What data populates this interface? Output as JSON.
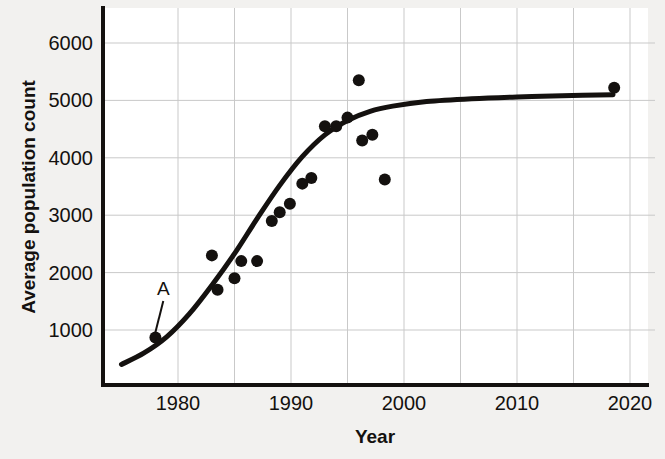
{
  "chart_data": {
    "type": "scatter",
    "title": "",
    "xlabel": "Year",
    "ylabel": "Average population count",
    "xlim": [
      1975,
      2021.5
    ],
    "ylim": [
      0,
      6600
    ],
    "grid": true,
    "legend": "none",
    "xticks": [
      1980,
      1990,
      2000,
      2010,
      2020
    ],
    "xtick_labels": [
      "1980",
      "1990",
      "2000",
      "2010",
      "2020"
    ],
    "xgridlines": [
      1980,
      1985,
      1990,
      1995,
      2000,
      2005,
      2010,
      2015,
      2020
    ],
    "yticks": [
      1000,
      2000,
      3000,
      4000,
      5000,
      6000
    ],
    "ytick_labels": [
      "1000",
      "2000",
      "3000",
      "4000",
      "5000",
      "6000"
    ],
    "series": [
      {
        "name": "Average population count",
        "marker": "filled-circle",
        "color": "#14110f",
        "points": [
          {
            "x": 1978.0,
            "y": 870
          },
          {
            "x": 1983.0,
            "y": 2300
          },
          {
            "x": 1983.5,
            "y": 1700
          },
          {
            "x": 1985.0,
            "y": 1900
          },
          {
            "x": 1985.6,
            "y": 2200
          },
          {
            "x": 1987.0,
            "y": 2200
          },
          {
            "x": 1988.3,
            "y": 2900
          },
          {
            "x": 1989.0,
            "y": 3050
          },
          {
            "x": 1989.9,
            "y": 3200
          },
          {
            "x": 1991.0,
            "y": 3550
          },
          {
            "x": 1991.8,
            "y": 3650
          },
          {
            "x": 1993.0,
            "y": 4550
          },
          {
            "x": 1994.0,
            "y": 4550
          },
          {
            "x": 1995.0,
            "y": 4700
          },
          {
            "x": 1996.0,
            "y": 5350
          },
          {
            "x": 1996.3,
            "y": 4300
          },
          {
            "x": 1997.2,
            "y": 4400
          },
          {
            "x": 1998.3,
            "y": 3620
          },
          {
            "x": 2018.6,
            "y": 5220
          }
        ]
      }
    ],
    "fit_curve": {
      "name": "logistic-trend-line",
      "color": "#14110f",
      "description": "sigmoidal best-fit curve rising from ~400 in 1975 to a plateau near 5100 after 2005",
      "points": [
        {
          "x": 1975.0,
          "y": 400
        },
        {
          "x": 1977.0,
          "y": 600
        },
        {
          "x": 1979.0,
          "y": 880
        },
        {
          "x": 1981.0,
          "y": 1280
        },
        {
          "x": 1983.0,
          "y": 1780
        },
        {
          "x": 1985.0,
          "y": 2330
        },
        {
          "x": 1987.0,
          "y": 2940
        },
        {
          "x": 1989.0,
          "y": 3520
        },
        {
          "x": 1991.0,
          "y": 4020
        },
        {
          "x": 1993.0,
          "y": 4400
        },
        {
          "x": 1995.0,
          "y": 4650
        },
        {
          "x": 1997.0,
          "y": 4810
        },
        {
          "x": 1999.0,
          "y": 4900
        },
        {
          "x": 2002.0,
          "y": 4980
        },
        {
          "x": 2006.0,
          "y": 5030
        },
        {
          "x": 2010.0,
          "y": 5060
        },
        {
          "x": 2014.0,
          "y": 5080
        },
        {
          "x": 2018.5,
          "y": 5100
        }
      ]
    },
    "annotations": [
      {
        "label": "A",
        "label_x": 1978.7,
        "label_y": 1610,
        "target_x": 1978.0,
        "target_y": 960,
        "description": "leader line from label A down to the leftmost data point"
      }
    ]
  }
}
